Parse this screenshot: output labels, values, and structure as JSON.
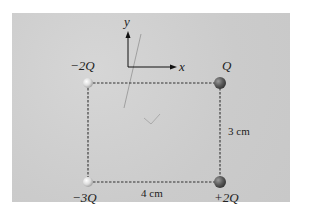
{
  "diagram": {
    "type": "point charges at rectangle corners",
    "axes": {
      "x_label": "x",
      "y_label": "y"
    },
    "charges": [
      {
        "position": "top-left",
        "label": "−2Q",
        "color": "#e8e8e8"
      },
      {
        "position": "top-right",
        "label": "Q",
        "color": "#555555"
      },
      {
        "position": "bottom-left",
        "label": "−3Q",
        "color": "#e8e8e8"
      },
      {
        "position": "bottom-right",
        "label": "+2Q",
        "color": "#555555"
      }
    ],
    "dimensions": {
      "width_label": "4 cm",
      "height_label": "3 cm"
    },
    "colors": {
      "background": "#cfcfcf",
      "lines": "#333333"
    }
  }
}
